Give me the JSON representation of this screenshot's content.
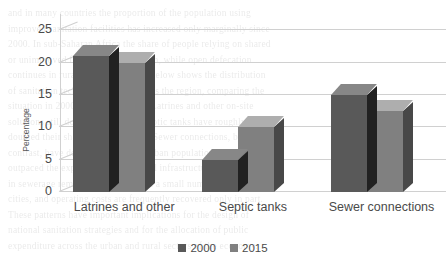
{
  "chart_data": {
    "type": "bar",
    "title": "",
    "xlabel": "",
    "ylabel": "Percentage",
    "ylim": [
      0,
      27.5
    ],
    "yticks": [
      0,
      5,
      10,
      15,
      20,
      25
    ],
    "grid": true,
    "legend_position": "bottom",
    "style": "3d-clustered-column",
    "categories": [
      "Latrines and other",
      "Septic tanks",
      "Sewer connections"
    ],
    "series": [
      {
        "name": "2000",
        "color": "#595959",
        "values": [
          21,
          5,
          15
        ]
      },
      {
        "name": "2015",
        "color": "#808080",
        "values": [
          20,
          10,
          12.5
        ]
      }
    ]
  },
  "background_text": {
    "lines": [
      "and in many countries the proportion of the population using",
      "improved sanitation facilities has increased only marginally since",
      "2000. In sub-Saharan Africa the share of people relying on shared",
      "or unimproved facilities remains high, while open defecation",
      "continues in rural areas. The figure below shows the distribution",
      "of sanitation technologies used across the region, comparing the",
      "situation in 2000 with that in 2015. Latrines and other on-site",
      "solutions still dominate, although septic tanks have roughly",
      "doubled their share over the period. Sewer connections, by",
      "contrast, have declined slightly as urban population growth has",
      "outpaced the expansion of networked infrastructure. Investment",
      "in sewerage remains concentrated in a small number of large",
      "cities, and operating costs are frequently recovered only in part.",
      "These patterns have important implications for the design of",
      "national sanitation strategies and for the allocation of public",
      "expenditure across the urban and rural sectors of the economy."
    ]
  }
}
